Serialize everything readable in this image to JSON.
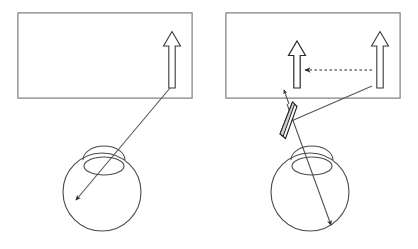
{
  "figure": {
    "type": "optics-ray-diagram",
    "canvas": {
      "width": 418,
      "height": 249
    },
    "colors": {
      "background": "#ffffff",
      "frame_stroke": "#8a8a8a",
      "stipple_dark": "#545454",
      "stipple_light": "#f2f2f2",
      "ray_stroke": "#555555",
      "arrow_fill": "#ffffff",
      "arrow_stroke": "#2b2b2b",
      "prism_stroke": "#1f1f1f",
      "eye_stroke": "#4a4a4a"
    },
    "panels": [
      {
        "id": "left-panel",
        "name": "no-prism-condition",
        "caption": "",
        "scene": {
          "frame": {
            "x": 18,
            "y": 13,
            "width": 174,
            "height": 85
          },
          "shaded_half": {
            "x": 105,
            "y": 13,
            "width": 87,
            "height": 85,
            "pattern": "checkerboard-stipple"
          },
          "arrows": [
            {
              "id": "real-object-arrow",
              "style": "white-filled",
              "x": 172,
              "tip_y": 33,
              "tail_y": 88,
              "on_shaded": true
            }
          ],
          "rays": [
            {
              "id": "object-to-retina-ray",
              "from": [
                169,
                88
              ],
              "to": [
                73,
                203
              ],
              "arrowhead": "end",
              "style": "solid"
            }
          ]
        },
        "eye": {
          "id": "left-eye",
          "globe": {
            "cx": 102,
            "cy": 192,
            "r": 39
          },
          "cornea": {
            "cx": 104,
            "cy": 155,
            "rx": 21,
            "ry": 12
          },
          "lens": {
            "cx": 104,
            "cy": 166,
            "rx": 20,
            "ry": 9
          },
          "retina_image_point": [
            73,
            203
          ]
        }
      },
      {
        "id": "right-panel",
        "name": "prism-condition",
        "caption": "",
        "scene": {
          "frame": {
            "x": 226,
            "y": 13,
            "width": 174,
            "height": 85
          },
          "shaded_half": {
            "x": 313,
            "y": 13,
            "width": 87,
            "height": 85,
            "pattern": "checkerboard-stipple"
          },
          "arrows": [
            {
              "id": "perceived-object-arrow",
              "style": "outline",
              "x": 297,
              "tip_y": 42,
              "tail_y": 88,
              "on_shaded": false
            },
            {
              "id": "real-object-arrow",
              "style": "white-filled",
              "x": 380,
              "tip_y": 33,
              "tail_y": 88,
              "on_shaded": true
            }
          ],
          "rays": [
            {
              "id": "apparent-displacement-arrow",
              "from": [
                370,
                70
              ],
              "to": [
                303,
                70
              ],
              "arrowhead": "end",
              "style": "dashed"
            },
            {
              "id": "object-to-prism-ray",
              "from": [
                371,
                86
              ],
              "to": [
                292,
                120
              ],
              "arrowhead": "none",
              "style": "solid"
            },
            {
              "id": "prism-to-retina-ray",
              "from": [
                288,
                108
              ],
              "to": [
                333,
                228
              ],
              "arrowhead": "end",
              "style": "solid"
            },
            {
              "id": "perceived-direction-ray",
              "from": [
                288,
                100
              ],
              "to": [
                283,
                88
              ],
              "arrowhead": "end",
              "style": "solid"
            }
          ],
          "prism": {
            "id": "prism-wedge",
            "name": "prism",
            "apex": [
              292,
              103
            ],
            "base": [
              280,
              137
            ],
            "note": "narrow wedge placed in front of the eye"
          }
        },
        "eye": {
          "id": "right-eye",
          "globe": {
            "cx": 310,
            "cy": 192,
            "r": 39
          },
          "cornea": {
            "cx": 312,
            "cy": 155,
            "rx": 21,
            "ry": 12
          },
          "lens": {
            "cx": 312,
            "cy": 166,
            "rx": 20,
            "ry": 9
          },
          "retina_image_point": [
            333,
            228
          ]
        }
      }
    ],
    "labels": []
  }
}
